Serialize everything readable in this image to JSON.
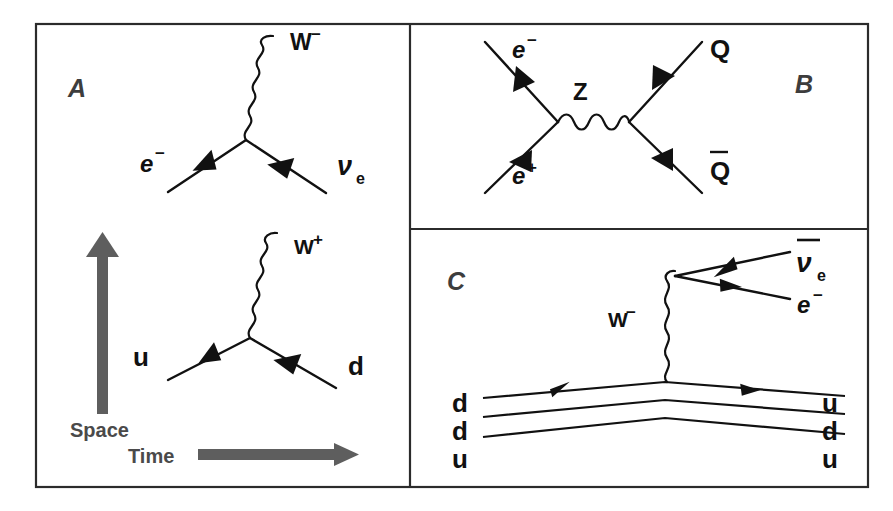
{
  "figure": {
    "type": "feynman-diagram-panel-figure",
    "background_color": "#ffffff",
    "frame_color": "#2b2b2b",
    "line_color": "#111111",
    "axis_arrow_color": "#5e5e5e",
    "panel_label_color": "#3d3d3d"
  },
  "panels": {
    "a": {
      "label": "A",
      "diagrams": [
        {
          "name": "electron-to-neutrino-w-emission",
          "incoming_label": "e",
          "incoming_superscript": "−",
          "outgoing_label": "ν",
          "outgoing_subscript": "e",
          "boson_label": "W",
          "boson_superscript": "−"
        },
        {
          "name": "up-to-down-w-emission",
          "incoming_label": "u",
          "outgoing_label": "d",
          "boson_label": "W",
          "boson_superscript": "+"
        }
      ],
      "axes": {
        "vertical_label": "Space",
        "horizontal_label": "Time"
      }
    },
    "b": {
      "label": "B",
      "diagram": {
        "name": "electron-positron-annihilation-to-quark-pair",
        "incoming_top_label": "e",
        "incoming_top_superscript": "−",
        "incoming_bottom_label": "e",
        "incoming_bottom_superscript": "+",
        "mediator_label": "Z",
        "outgoing_top_label": "Q",
        "outgoing_bottom_label": "Q",
        "outgoing_bottom_has_overbar": true
      }
    },
    "c": {
      "label": "C",
      "diagram": {
        "name": "neutron-beta-decay",
        "initial_quarks": [
          "d",
          "d",
          "u"
        ],
        "final_quarks": [
          "u",
          "d",
          "u"
        ],
        "boson_label": "W",
        "boson_superscript": "−",
        "lepton_top_label": "ν",
        "lepton_top_subscript": "e",
        "lepton_top_has_overbar": true,
        "lepton_bottom_label": "e",
        "lepton_bottom_superscript": "−"
      }
    }
  }
}
